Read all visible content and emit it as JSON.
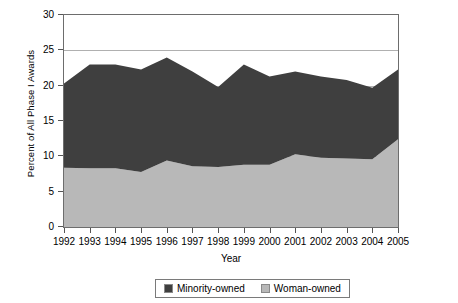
{
  "chart_data": {
    "type": "area",
    "stacked": true,
    "title": "",
    "xlabel": "Year",
    "ylabel": "Percent of All Phase I Awards",
    "categories": [
      "1992",
      "1993",
      "1994",
      "1995",
      "1996",
      "1997",
      "1998",
      "1999",
      "2000",
      "2001",
      "2002",
      "2003",
      "2004",
      "2005"
    ],
    "ylim": [
      0,
      30
    ],
    "yticks": [
      0,
      5,
      10,
      15,
      20,
      25,
      30
    ],
    "grid": true,
    "legend_position": "bottom",
    "series": [
      {
        "name": "Woman-owned",
        "color": "#b8b8b8",
        "values": [
          8.4,
          8.3,
          8.3,
          7.8,
          9.4,
          8.6,
          8.5,
          8.8,
          8.8,
          10.3,
          9.8,
          9.7,
          9.6,
          12.4
        ]
      },
      {
        "name": "Minority-owned",
        "color": "#3f3f3f",
        "values": [
          11.9,
          14.7,
          14.7,
          14.5,
          14.6,
          13.4,
          11.3,
          14.2,
          12.5,
          11.7,
          11.5,
          11.1,
          10.1,
          9.9
        ]
      }
    ],
    "cumulative_top": [
      20.3,
      23.0,
      23.0,
      22.3,
      24.0,
      22.0,
      19.8,
      23.0,
      21.3,
      22.0,
      21.3,
      20.8,
      19.7,
      22.3
    ]
  },
  "legend": {
    "items": [
      {
        "label": "Minority-owned",
        "color": "#3f3f3f",
        "icon": "legend-swatch-dark"
      },
      {
        "label": "Woman-owned",
        "color": "#b8b8b8",
        "icon": "legend-swatch-light"
      }
    ]
  },
  "axes": {
    "y_title": "Percent of All Phase I Awards",
    "x_title": "Year",
    "y_tick_labels": [
      "0",
      "5",
      "10",
      "15",
      "20",
      "25",
      "30"
    ],
    "x_tick_labels": [
      "1992",
      "1993",
      "1994",
      "1995",
      "1996",
      "1997",
      "1998",
      "1999",
      "2000",
      "2001",
      "2002",
      "2003",
      "2004",
      "2005"
    ]
  },
  "colors": {
    "minority": "#3f3f3f",
    "woman": "#b8b8b8",
    "grid": "#b0b0b0",
    "frame": "#6d6d6d",
    "background": "#ffffff"
  }
}
